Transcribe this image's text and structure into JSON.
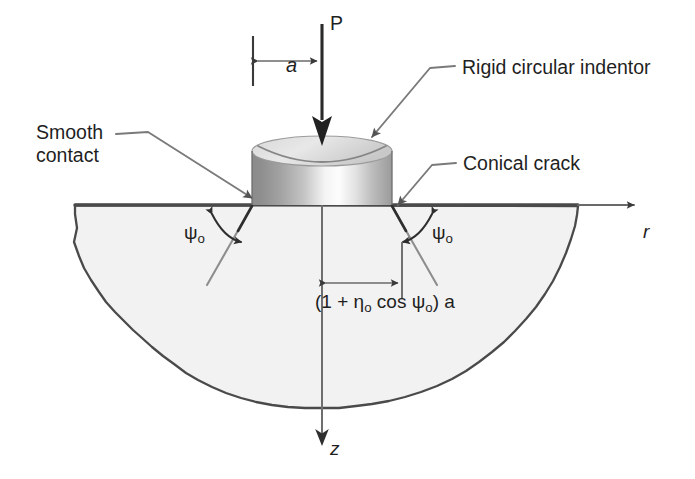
{
  "figure": {
    "background_color": "#ffffff",
    "line_color": "#3a3a3a",
    "body_fill_color": "#f2f2f2",
    "indentor_dark": "#7d7d7d",
    "indentor_light": "#fbfbfb",
    "indentor_top_fill": "#cfcfcf"
  },
  "labels": {
    "smooth_contact_line1": "Smooth",
    "smooth_contact_line2": "contact",
    "rigid_indentor": "Rigid circular indentor",
    "conical_crack": "Conical crack",
    "load": "P",
    "contact_radius": "a",
    "axis_r": "r",
    "axis_z": "z",
    "psi_left_base": "ψ",
    "psi_left_sub": "o",
    "psi_right_base": "ψ",
    "psi_right_sub": "o"
  },
  "formula": {
    "open_paren": "(1 + ",
    "eta": "η",
    "eta_sub": "o",
    "cos": " cos ",
    "psi": "ψ",
    "psi_sub": "o",
    "close": ") a",
    "full_text": "(1 + ηo cos ψo) a",
    "meaning": "radial distance from load axis to the surface ring crack trace"
  },
  "geometry": {
    "surface_y": 205,
    "axis_x": 322,
    "indentor_left_x": 252,
    "indentor_right_x": 392,
    "indentor_top_y": 142,
    "body_left_x": 75,
    "body_right_x": 578,
    "body_bottom_y": 408,
    "contact_radius_px": 70,
    "crack_ring_radius_px": 80,
    "cone_half_angle_label": "ψo"
  },
  "icons": {
    "load_arrow": "down-arrow-icon",
    "r_axis_arrow": "right-arrow-icon",
    "z_axis_arrow": "down-arrow-icon",
    "dimension_arrow": "double-headed-arrow-icon",
    "angle_arc": "curved-double-arrow-icon",
    "leader": "leader-line-icon"
  }
}
